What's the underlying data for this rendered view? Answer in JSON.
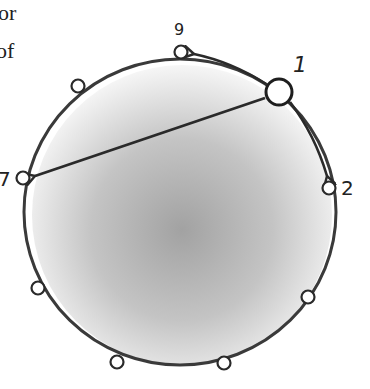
{
  "text_fragments": [
    "or",
    "of"
  ],
  "diagram": {
    "ring": {
      "cx": 180,
      "cy": 212,
      "rx": 155,
      "ry": 154
    },
    "nodes": [
      {
        "id": "1",
        "label": "1",
        "x": 279,
        "y": 92,
        "r": 14,
        "highlight": true
      },
      {
        "id": "9",
        "label": "9",
        "x": 181,
        "y": 52,
        "r": 7
      },
      {
        "id": "n-a",
        "label": "",
        "x": 78,
        "y": 86,
        "r": 7
      },
      {
        "id": "7",
        "label": "7",
        "x": 23,
        "y": 178,
        "r": 7
      },
      {
        "id": "n-b",
        "label": "",
        "x": 38,
        "y": 288,
        "r": 7
      },
      {
        "id": "n-c",
        "label": "",
        "x": 117,
        "y": 362,
        "r": 7
      },
      {
        "id": "n-d",
        "label": "",
        "x": 224,
        "y": 363,
        "r": 7
      },
      {
        "id": "n-e",
        "label": "",
        "x": 308,
        "y": 297,
        "r": 7
      },
      {
        "id": "2",
        "label": "2",
        "x": 329,
        "y": 188,
        "r": 7
      }
    ],
    "arrows": [
      {
        "from": "1",
        "to": "9",
        "type": "arc"
      },
      {
        "from": "1",
        "to": "2",
        "type": "arc"
      },
      {
        "from": "1",
        "to": "7",
        "type": "chord"
      }
    ],
    "colors": {
      "stroke": "#3a3a3a",
      "fill_center": "#9a9a9a",
      "fill_edge": "#f4f4f4"
    }
  }
}
